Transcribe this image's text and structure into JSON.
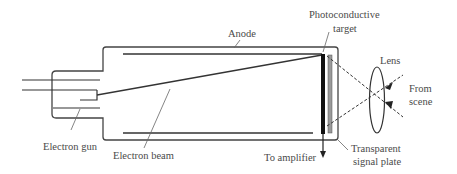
{
  "diagram": {
    "labels": {
      "anode": "Anode",
      "photoconductive_target_line1": "Photoconductive",
      "photoconductive_target_line2": "target",
      "lens": "Lens",
      "from_scene_line1": "From",
      "from_scene_line2": "scene",
      "electron_gun": "Electron gun",
      "electron_beam": "Electron beam",
      "to_amplifier": "To amplifier",
      "transparent_signal_plate_line1": "Transparent",
      "transparent_signal_plate_line2": "signal plate"
    },
    "colors": {
      "line": "#333333",
      "leader": "#666666",
      "target": "#111111",
      "signal_plate": "#9a9a9a",
      "text": "#4a4a4a"
    }
  }
}
